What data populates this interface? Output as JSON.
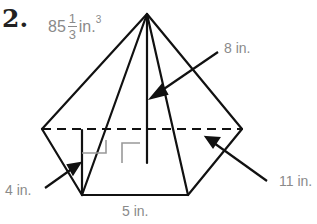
{
  "problem": {
    "number": "2.",
    "answer": {
      "whole": "85",
      "numerator": "1",
      "denominator": "3",
      "unit": "in.",
      "exponent": "3"
    }
  },
  "labels": {
    "slant_height": "8 in.",
    "apothem": "4 in.",
    "side": "5 in.",
    "height": "11 in."
  },
  "colors": {
    "lines": "#111111",
    "labels": "#8a8a8a",
    "hidden": "#999999"
  }
}
